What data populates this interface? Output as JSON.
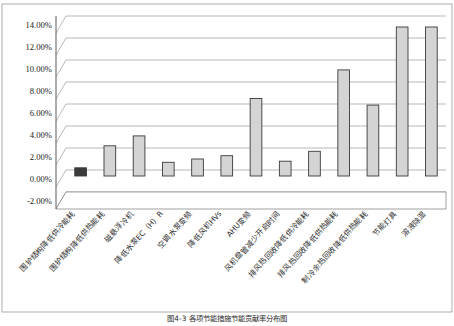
{
  "chart_data": {
    "type": "bar",
    "title": "",
    "xlabel": "",
    "ylabel": "",
    "ylim": [
      -0.02,
      0.14
    ],
    "grid": true,
    "legend": false,
    "legend_position": "none",
    "ytick_labels": [
      "14.00%",
      "12.00%",
      "10.00%",
      "8.00%",
      "6.00%",
      "4.00%",
      "2.00%",
      "0.00%",
      "-2.00%"
    ],
    "ytick_values": [
      0.14,
      0.12,
      0.1,
      0.08,
      0.06,
      0.04,
      0.02,
      0.0,
      -0.02
    ],
    "categories": [
      "围护结构降低供冷能耗",
      "围护结构降低供热能耗",
      "磁悬浮冷机",
      "降低水泵EC（H）R",
      "空调水泵变频",
      "降低风机HVs",
      "AHU变频",
      "风机盘管减少开启时间",
      "排风热回收降低供冷能耗",
      "排风热回收降低供热能耗",
      "制冷余热回收降低供热能耗",
      "节能灯具",
      "溶液除湿"
    ],
    "values": [
      0.002,
      0.022,
      0.031,
      0.007,
      0.01,
      0.013,
      0.065,
      0.008,
      0.017,
      0.091,
      0.059,
      0.13,
      0.13
    ],
    "value_labels": [
      "0.20%",
      "2.20%",
      "3.10%",
      "0.70%",
      "1.00%",
      "1.30%",
      "6.50%",
      "0.80%",
      "1.70%",
      "9.10%",
      "5.90%",
      "13.00%",
      "13.00%"
    ],
    "series": [
      {
        "name": "节能率",
        "values": [
          0.002,
          0.022,
          0.031,
          0.007,
          0.01,
          0.013,
          0.065,
          0.008,
          0.017,
          0.091,
          0.059,
          0.13,
          0.13
        ]
      }
    ],
    "bar_fill_color": "#d4d4d4",
    "bar_stroke_color": "#3a3a3a",
    "grid_color": "#9a9a9a",
    "axis_color": "#5a5a5a",
    "background_color": "#ffffff"
  },
  "caption": {
    "text": "图4-3 各项节能措施节能贡献率分布图"
  }
}
